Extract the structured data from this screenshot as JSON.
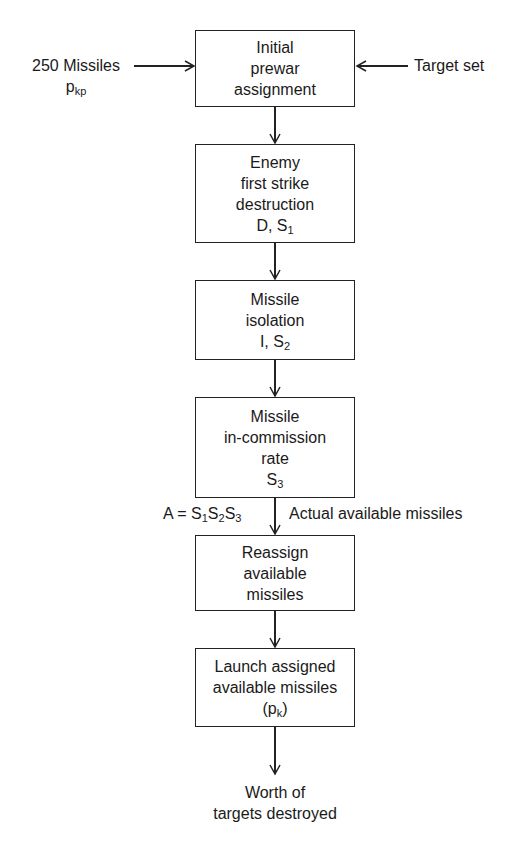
{
  "inputs": {
    "left": {
      "line1": "250 Missiles",
      "var": "p",
      "var_sub": "kp"
    },
    "right": {
      "label": "Target set"
    }
  },
  "boxes": [
    {
      "lines": [
        "Initial",
        "prewar",
        "assignment"
      ]
    },
    {
      "lines": [
        "Enemy",
        "first strike",
        "destruction"
      ],
      "var": "D, S",
      "var_sub": "1"
    },
    {
      "lines": [
        "Missile",
        "isolation"
      ],
      "var": "I, S",
      "var_sub": "2"
    },
    {
      "lines": [
        "Missile",
        "in-commission",
        "rate"
      ],
      "var": "S",
      "var_sub": "3"
    },
    {
      "lines": [
        "Reassign",
        "available",
        "missiles"
      ]
    },
    {
      "lines": [
        "Launch assigned",
        "available missiles"
      ],
      "var_open": "(p",
      "var_sub": "k",
      "var_close": ")"
    }
  ],
  "annotation": {
    "formula_prefix": "A = S",
    "s1": "1",
    "s": "S",
    "s2": "2",
    "s3": "3",
    "description": "Actual available missiles"
  },
  "output": {
    "line1": "Worth of",
    "line2": "targets destroyed"
  }
}
